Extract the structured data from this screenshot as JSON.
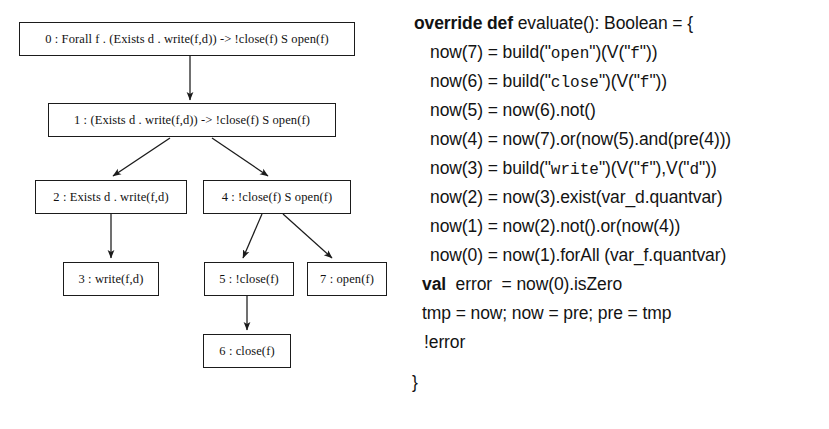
{
  "figure": {
    "background_color": "#ffffff",
    "ink_color": "#131313"
  },
  "tree": {
    "title": "syntax tree",
    "nodes": [
      {
        "id": "node-0",
        "label": "0 : Forall f . (Exists d . write(f,d)) -> !close(f) S open(f)",
        "x": 19,
        "y": 22,
        "w": 336,
        "h": 34
      },
      {
        "id": "node-1",
        "label": "1 : (Exists d . write(f,d)) -> !close(f) S open(f)",
        "x": 48,
        "y": 103,
        "w": 288,
        "h": 34
      },
      {
        "id": "node-2",
        "label": "2 : Exists d . write(f,d)",
        "x": 35,
        "y": 180,
        "w": 152,
        "h": 34
      },
      {
        "id": "node-4",
        "label": "4 : !close(f) S open(f)",
        "x": 203,
        "y": 180,
        "w": 148,
        "h": 34
      },
      {
        "id": "node-3",
        "label": "3 : write(f,d)",
        "x": 63,
        "y": 262,
        "w": 96,
        "h": 34
      },
      {
        "id": "node-5",
        "label": "5 : !close(f)",
        "x": 204,
        "y": 262,
        "w": 90,
        "h": 34
      },
      {
        "id": "node-7",
        "label": "7 : open(f)",
        "x": 307,
        "y": 262,
        "w": 80,
        "h": 34
      },
      {
        "id": "node-6",
        "label": "6 : close(f)",
        "x": 203,
        "y": 334,
        "w": 88,
        "h": 34
      }
    ],
    "edges": [
      {
        "from": "node-0",
        "to": "node-1"
      },
      {
        "from": "node-1",
        "to": "node-2"
      },
      {
        "from": "node-1",
        "to": "node-4"
      },
      {
        "from": "node-2",
        "to": "node-3"
      },
      {
        "from": "node-4",
        "to": "node-5"
      },
      {
        "from": "node-4",
        "to": "node-7"
      },
      {
        "from": "node-5",
        "to": "node-6"
      }
    ]
  },
  "code": {
    "language": "Scala",
    "lines": [
      {
        "id": "line-signature",
        "x": 4,
        "y": 13,
        "parts": [
          {
            "text": "override def ",
            "style": "kw"
          },
          {
            "text": "evaluate(): Boolean = {",
            "style": "plain"
          }
        ]
      },
      {
        "id": "line-now7",
        "x": 20,
        "y": 42,
        "parts": [
          {
            "text": "now(7) = build(\"",
            "style": "plain"
          },
          {
            "text": "open",
            "style": "str"
          },
          {
            "text": "\")(V(\"",
            "style": "plain"
          },
          {
            "text": "f",
            "style": "str"
          },
          {
            "text": "\"))",
            "style": "plain"
          }
        ]
      },
      {
        "id": "line-now6",
        "x": 20,
        "y": 71,
        "parts": [
          {
            "text": "now(6) = build(\"",
            "style": "plain"
          },
          {
            "text": "close",
            "style": "str"
          },
          {
            "text": "\")(V(\"",
            "style": "plain"
          },
          {
            "text": "f",
            "style": "str"
          },
          {
            "text": "\"))",
            "style": "plain"
          }
        ]
      },
      {
        "id": "line-now5",
        "x": 20,
        "y": 100,
        "parts": [
          {
            "text": "now(5) = now(6).not()",
            "style": "plain"
          }
        ]
      },
      {
        "id": "line-now4",
        "x": 20,
        "y": 129,
        "parts": [
          {
            "text": "now(4) = now(7).or(now(5).and(pre(4)))",
            "style": "plain"
          }
        ]
      },
      {
        "id": "line-now3",
        "x": 20,
        "y": 158,
        "parts": [
          {
            "text": "now(3) = build(\"",
            "style": "plain"
          },
          {
            "text": "write",
            "style": "str"
          },
          {
            "text": "\")(V(\"",
            "style": "plain"
          },
          {
            "text": "f",
            "style": "str"
          },
          {
            "text": "\"),V(\"",
            "style": "plain"
          },
          {
            "text": "d",
            "style": "str"
          },
          {
            "text": "\"))",
            "style": "plain"
          }
        ]
      },
      {
        "id": "line-now2",
        "x": 20,
        "y": 187,
        "parts": [
          {
            "text": "now(2) = now(3).exist(var_d.quantvar)",
            "style": "plain"
          }
        ]
      },
      {
        "id": "line-now1",
        "x": 20,
        "y": 216,
        "parts": [
          {
            "text": "now(1) = now(2).not().or(now(4))",
            "style": "plain"
          }
        ]
      },
      {
        "id": "line-now0",
        "x": 20,
        "y": 245,
        "parts": [
          {
            "text": "now(0) = now(1).forAll (var_f.quantvar)",
            "style": "plain"
          }
        ]
      },
      {
        "id": "line-val-error",
        "x": 12,
        "y": 274,
        "parts": [
          {
            "text": "val ",
            "style": "kw"
          },
          {
            "text": " error  = now(0).isZero",
            "style": "plain"
          }
        ]
      },
      {
        "id": "line-swap",
        "x": 12,
        "y": 303,
        "parts": [
          {
            "text": "tmp = now; now = pre; pre = tmp",
            "style": "plain"
          }
        ]
      },
      {
        "id": "line-not-error",
        "x": 14,
        "y": 332,
        "parts": [
          {
            "text": "!error",
            "style": "plain"
          }
        ]
      },
      {
        "id": "line-close-brace",
        "x": 2,
        "y": 372,
        "parts": [
          {
            "text": "}",
            "style": "plain"
          }
        ]
      }
    ]
  }
}
